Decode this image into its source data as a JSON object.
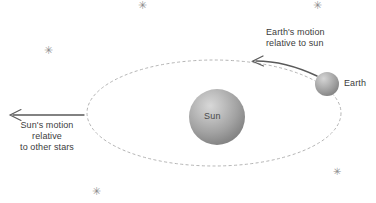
{
  "diagram": {
    "background_color": "#ffffff",
    "text_color": "#3c3c3c"
  },
  "labels": {
    "earth_motion": "Earth's motion\nrelative to sun",
    "sun_motion": "Sun's motion\nrelative\nto other stars",
    "earth": "Earth",
    "sun": "Sun"
  },
  "bodies": {
    "sun": {
      "name": "Sun",
      "cx": 217,
      "cy": 117,
      "r": 28,
      "color": "#9a9a9a"
    },
    "earth": {
      "name": "Earth",
      "cx": 327,
      "cy": 84,
      "r": 12,
      "color": "#9a9a9a"
    }
  },
  "orbit": {
    "name": "earth-orbit-ellipse",
    "cx": 214,
    "cy": 113,
    "rx": 127,
    "ry": 53,
    "style": "dashed",
    "color": "#a8a8a8"
  },
  "arrows": {
    "earth_motion": {
      "name": "earth-motion-arrow",
      "style": "curved",
      "direction": "left",
      "color": "#555555"
    },
    "sun_motion": {
      "name": "sun-motion-arrow",
      "style": "straight",
      "direction": "left",
      "color": "#555555"
    }
  },
  "stars": [
    {
      "glyph": "✳",
      "x": 138,
      "y": 0,
      "size": 11
    },
    {
      "glyph": "✳",
      "x": 313,
      "y": 0,
      "size": 11
    },
    {
      "glyph": "✳",
      "x": 44,
      "y": 45,
      "size": 11
    },
    {
      "glyph": "✳",
      "x": 92,
      "y": 186,
      "size": 11
    },
    {
      "glyph": "✳",
      "x": 333,
      "y": 166,
      "size": 10
    }
  ],
  "chart_data": {
    "type": "diagram",
    "elements": [
      {
        "label": "Sun",
        "role": "central-body",
        "x": 217,
        "y": 117
      },
      {
        "label": "Earth",
        "role": "orbiting-body",
        "x": 327,
        "y": 84
      },
      {
        "label": "Earth's motion relative to sun",
        "role": "annotation-arrow",
        "direction": "counterclockwise-along-orbit"
      },
      {
        "label": "Sun's motion relative to other stars",
        "role": "annotation-arrow",
        "direction": "left"
      }
    ]
  }
}
